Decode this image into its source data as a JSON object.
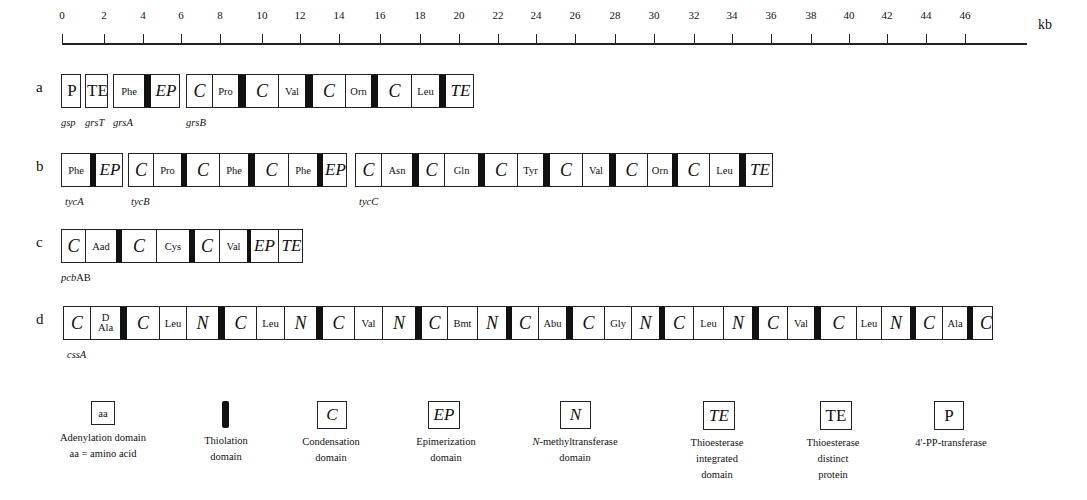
{
  "scale": {
    "unit": "kb",
    "ticks": [
      "0",
      "2",
      "4",
      "6",
      "8",
      "10",
      "12",
      "14",
      "16",
      "18",
      "20",
      "22",
      "24",
      "26",
      "28",
      "30",
      "32",
      "34",
      "36",
      "38",
      "40",
      "42",
      "44",
      "46"
    ],
    "tick_x": [
      62,
      104,
      143,
      181,
      220,
      262,
      300,
      339,
      380,
      420,
      459,
      498,
      536,
      575,
      615,
      654,
      694,
      732,
      771,
      811,
      849,
      887,
      926,
      965
    ]
  },
  "rows": [
    {
      "label": "a",
      "y": 74,
      "modules": [
        {
          "x": 61,
          "w": 20,
          "gene": "gsp",
          "gene_x": 61,
          "cells": [
            {
              "t": "P",
              "k": "plain",
              "w": 20
            }
          ]
        },
        {
          "x": 85,
          "w": 23,
          "gene": "grsT",
          "gene_x": 85,
          "cells": [
            {
              "t": "TE",
              "k": "plain",
              "w": 23
            }
          ]
        },
        {
          "x": 113,
          "w": 67,
          "gene": "grsA",
          "gene_x": 113,
          "cells": [
            {
              "t": "Phe",
              "k": "aa",
              "w": 30
            },
            {
              "t": "",
              "k": "T",
              "w": 7
            },
            {
              "t": "EP",
              "k": "ital EP",
              "w": 30
            }
          ]
        },
        {
          "x": 186,
          "w": 288,
          "gene": "grsB",
          "gene_x": 186,
          "cells": [
            {
              "t": "C",
              "k": "ital",
              "w": 25
            },
            {
              "t": "Pro",
              "k": "aa",
              "w": 26
            },
            {
              "t": "",
              "k": "T",
              "w": 8
            },
            {
              "t": "C",
              "k": "ital",
              "w": 32
            },
            {
              "t": "Val",
              "k": "aa",
              "w": 27
            },
            {
              "t": "",
              "k": "T",
              "w": 8
            },
            {
              "t": "C",
              "k": "ital",
              "w": 32
            },
            {
              "t": "Orn",
              "k": "aa",
              "w": 26
            },
            {
              "t": "",
              "k": "T",
              "w": 7
            },
            {
              "t": "C",
              "k": "ital",
              "w": 33
            },
            {
              "t": "Leu",
              "k": "aa",
              "w": 28
            },
            {
              "t": "",
              "k": "T",
              "w": 7
            },
            {
              "t": "TE",
              "k": "ital TE",
              "w": 29
            }
          ]
        }
      ]
    },
    {
      "label": "b",
      "y": 153,
      "modules": [
        {
          "x": 61,
          "w": 62,
          "gene": "tycA",
          "gene_x": 65,
          "cells": [
            {
              "t": "Phe",
              "k": "aa",
              "w": 28
            },
            {
              "t": "",
              "k": "T",
              "w": 6
            },
            {
              "t": "EP",
              "k": "ital EP",
              "w": 28
            }
          ]
        },
        {
          "x": 128,
          "w": 219,
          "gene": "tycB",
          "gene_x": 131,
          "cells": [
            {
              "t": "C",
              "k": "ital",
              "w": 24
            },
            {
              "t": "Pro",
              "k": "aa",
              "w": 28
            },
            {
              "t": "",
              "k": "T",
              "w": 6
            },
            {
              "t": "C",
              "k": "ital",
              "w": 32
            },
            {
              "t": "Phe",
              "k": "aa",
              "w": 29
            },
            {
              "t": "",
              "k": "T",
              "w": 7
            },
            {
              "t": "C",
              "k": "ital",
              "w": 33
            },
            {
              "t": "Phe",
              "k": "aa",
              "w": 29
            },
            {
              "t": "",
              "k": "T",
              "w": 6
            },
            {
              "t": "EP",
              "k": "ital EP",
              "w": 25
            }
          ]
        },
        {
          "x": 355,
          "w": 418,
          "gene": "tycC",
          "gene_x": 359,
          "cells": [
            {
              "t": "C",
              "k": "ital",
              "w": 25
            },
            {
              "t": "Asn",
              "k": "aa",
              "w": 31
            },
            {
              "t": "",
              "k": "T",
              "w": 7
            },
            {
              "t": "C",
              "k": "ital",
              "w": 25
            },
            {
              "t": "Gln",
              "k": "aa",
              "w": 34
            },
            {
              "t": "",
              "k": "T",
              "w": 7
            },
            {
              "t": "C",
              "k": "ital",
              "w": 32
            },
            {
              "t": "Tyr",
              "k": "aa",
              "w": 26
            },
            {
              "t": "",
              "k": "T",
              "w": 7
            },
            {
              "t": "C",
              "k": "ital",
              "w": 32
            },
            {
              "t": "Val",
              "k": "aa",
              "w": 27
            },
            {
              "t": "",
              "k": "T",
              "w": 7
            },
            {
              "t": "C",
              "k": "ital",
              "w": 31
            },
            {
              "t": "Orn",
              "k": "aa",
              "w": 25
            },
            {
              "t": "",
              "k": "T",
              "w": 6
            },
            {
              "t": "C",
              "k": "ital",
              "w": 31
            },
            {
              "t": "Leu",
              "k": "aa",
              "w": 30
            },
            {
              "t": "",
              "k": "T",
              "w": 7
            },
            {
              "t": "TE",
              "k": "ital TE",
              "w": 28
            }
          ]
        }
      ]
    },
    {
      "label": "c",
      "y": 229,
      "modules": [
        {
          "x": 61,
          "w": 242,
          "gene": "pcbAB",
          "gene_x": 61,
          "cells": [
            {
              "t": "C",
              "k": "ital",
              "w": 23
            },
            {
              "t": "Aad",
              "k": "aa",
              "w": 31
            },
            {
              "t": "",
              "k": "T",
              "w": 6
            },
            {
              "t": "C",
              "k": "ital",
              "w": 34
            },
            {
              "t": "Cys",
              "k": "aa",
              "w": 33
            },
            {
              "t": "",
              "k": "T",
              "w": 6
            },
            {
              "t": "C",
              "k": "ital",
              "w": 24
            },
            {
              "t": "Val",
              "k": "aa",
              "w": 28
            },
            {
              "t": "",
              "k": "T",
              "w": 4
            },
            {
              "t": "EP",
              "k": "ital EP",
              "w": 27
            },
            {
              "t": "TE",
              "k": "ital TE",
              "w": 26
            }
          ]
        }
      ]
    },
    {
      "label": "d",
      "y": 306,
      "modules": [
        {
          "x": 63,
          "w": 930,
          "gene": "cssA",
          "gene_x": 67,
          "cells": [
            {
              "t": "C",
              "k": "ital",
              "w": 26
            },
            {
              "t": "D|Ala",
              "k": "dala",
              "w": 30
            },
            {
              "t": "",
              "k": "T",
              "w": 7
            },
            {
              "t": "C",
              "k": "ital",
              "w": 32
            },
            {
              "t": "Leu",
              "k": "aa",
              "w": 27
            },
            {
              "t": "N",
              "k": "ital",
              "w": 32
            },
            {
              "t": "",
              "k": "T",
              "w": 7
            },
            {
              "t": "C",
              "k": "ital",
              "w": 31
            },
            {
              "t": "Leu",
              "k": "aa",
              "w": 28
            },
            {
              "t": "N",
              "k": "ital",
              "w": 32
            },
            {
              "t": "",
              "k": "T",
              "w": 7
            },
            {
              "t": "C",
              "k": "ital",
              "w": 31
            },
            {
              "t": "Val",
              "k": "aa",
              "w": 28
            },
            {
              "t": "N",
              "k": "ital",
              "w": 33
            },
            {
              "t": "",
              "k": "T",
              "w": 7
            },
            {
              "t": "C",
              "k": "ital",
              "w": 25
            },
            {
              "t": "Bmt",
              "k": "aa",
              "w": 30
            },
            {
              "t": "N",
              "k": "ital",
              "w": 29
            },
            {
              "t": "",
              "k": "T",
              "w": 6
            },
            {
              "t": "C",
              "k": "ital",
              "w": 26
            },
            {
              "t": "Abu",
              "k": "aa",
              "w": 28
            },
            {
              "t": "",
              "k": "T",
              "w": 7
            },
            {
              "t": "C",
              "k": "ital",
              "w": 31
            },
            {
              "t": "Gly",
              "k": "aa",
              "w": 27
            },
            {
              "t": "N",
              "k": "ital",
              "w": 28
            },
            {
              "t": "",
              "k": "T",
              "w": 6
            },
            {
              "t": "C",
              "k": "ital",
              "w": 28
            },
            {
              "t": "Leu",
              "k": "aa",
              "w": 30
            },
            {
              "t": "N",
              "k": "ital",
              "w": 29
            },
            {
              "t": "",
              "k": "T",
              "w": 7
            },
            {
              "t": "C",
              "k": "ital",
              "w": 28
            },
            {
              "t": "Val",
              "k": "aa",
              "w": 27
            },
            {
              "t": "",
              "k": "T",
              "w": 7
            },
            {
              "t": "C",
              "k": "ital",
              "w": 35
            },
            {
              "t": "Leu",
              "k": "aa",
              "w": 25
            },
            {
              "t": "N",
              "k": "ital",
              "w": 29
            },
            {
              "t": "",
              "k": "T",
              "w": 6
            },
            {
              "t": "C",
              "k": "ital",
              "w": 26
            },
            {
              "t": "Ala",
              "k": "aa",
              "w": 25
            },
            {
              "t": "",
              "k": "T",
              "w": 6
            },
            {
              "t": "C",
              "k": "ital",
              "w": 26
            }
          ]
        }
      ]
    }
  ],
  "legend": [
    {
      "symbol": "aa",
      "style": "aa",
      "x": 91,
      "w": 24,
      "h": 24,
      "cx": 103,
      "lines": [
        "Adenylation domain",
        "aa = amino acid"
      ]
    },
    {
      "symbol": "",
      "style": "T",
      "x": 222,
      "w": 7,
      "h": 27,
      "cx": 226,
      "lines": [
        "Thiolation",
        "domain"
      ]
    },
    {
      "symbol": "C",
      "style": "ital",
      "x": 317,
      "w": 30,
      "h": 28,
      "cx": 331,
      "lines": [
        "Condensation",
        "domain"
      ]
    },
    {
      "symbol": "EP",
      "style": "ital",
      "x": 428,
      "w": 32,
      "h": 28,
      "cx": 446,
      "lines": [
        "Epimerization",
        "domain"
      ]
    },
    {
      "symbol": "N",
      "style": "ital",
      "x": 560,
      "w": 31,
      "h": 28,
      "cx": 575,
      "lines": [
        "N-methyltransferase",
        "domain"
      ]
    },
    {
      "symbol": "TE",
      "style": "ital",
      "x": 703,
      "w": 32,
      "h": 29,
      "cx": 717,
      "lines": [
        "Thioesterase",
        "integrated",
        "domain"
      ]
    },
    {
      "symbol": "TE",
      "style": "plain",
      "x": 820,
      "w": 32,
      "h": 29,
      "cx": 833,
      "lines": [
        "Thioesterase",
        "distinct",
        "protein"
      ]
    },
    {
      "symbol": "P",
      "style": "plain",
      "x": 934,
      "w": 30,
      "h": 29,
      "cx": 951,
      "lines": [
        "4'-PP-transferase"
      ]
    }
  ]
}
